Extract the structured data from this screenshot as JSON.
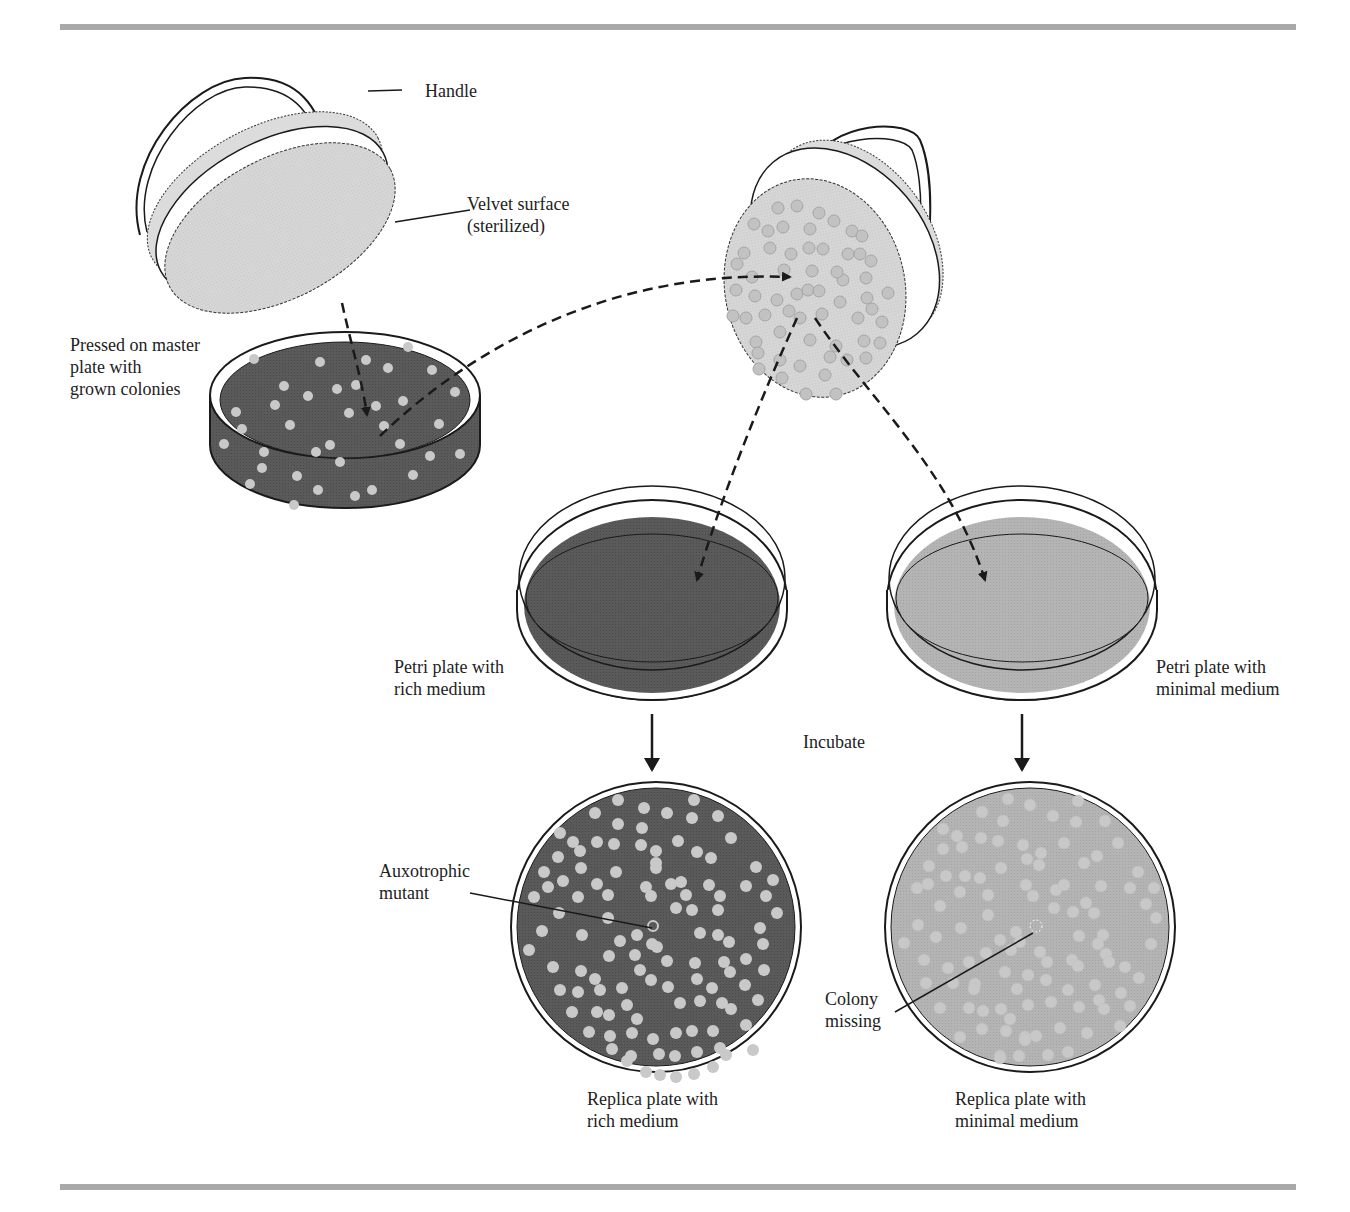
{
  "figure": {
    "colors": {
      "rich_medium": "#5a5a5a",
      "minimal_medium": "#b4b4b4",
      "velvet": "#d4d4d4",
      "colony_on_rich": "#c9c9c9",
      "colony_on_minimal": "#c8c8c8",
      "colony_on_velvet": "#c2c2c2",
      "rule": "#a9a9a9",
      "line": "#1a1a1a"
    },
    "labels": {
      "handle": "Handle",
      "velvet_surface": "Velvet surface\n(sterilized)",
      "pressed_on_master": "Pressed on master\nplate with\ngrown colonies",
      "petri_rich": "Petri plate with\nrich medium",
      "petri_minimal": "Petri plate with\nminimal medium",
      "incubate": "Incubate",
      "auxotrophic_mutant": "Auxotrophic\nmutant",
      "colony_missing": "Colony\nmissing",
      "replica_rich": "Replica plate with\nrich medium",
      "replica_minimal": "Replica plate with\nminimal medium"
    }
  }
}
